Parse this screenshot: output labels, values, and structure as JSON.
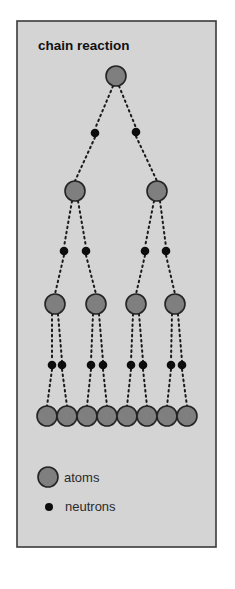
{
  "title": "chain reaction",
  "colors": {
    "page_background": "#ffffff",
    "panel_background": "#d4d4d4",
    "panel_border": "#3a3a3a",
    "atom_fill": "#7f7f7f",
    "atom_stroke": "#242424",
    "neutron_fill": "#0d0d0d",
    "link_color": "#1a1a1a"
  },
  "panel": {
    "x": 17,
    "y": 21,
    "width": 199,
    "height": 526
  },
  "legend": {
    "items": [
      {
        "label": "atoms",
        "symbol": "atom",
        "cx": 48,
        "cy": 477,
        "r": 10,
        "text_x": 64,
        "text_y": 482
      },
      {
        "label": "neutrons",
        "symbol": "neutron",
        "cx": 49,
        "cy": 507,
        "r": 4,
        "text_x": 65,
        "text_y": 511
      }
    ]
  },
  "diagram": {
    "atom_radius": 10,
    "neutron_radius": 4.3,
    "atoms": [
      {
        "id": "a0",
        "level": 0,
        "cx": 116,
        "cy": 76
      },
      {
        "id": "a1",
        "level": 1,
        "cx": 75,
        "cy": 191
      },
      {
        "id": "a2",
        "level": 1,
        "cx": 157,
        "cy": 191
      },
      {
        "id": "a3",
        "level": 2,
        "cx": 55,
        "cy": 304
      },
      {
        "id": "a4",
        "level": 2,
        "cx": 96,
        "cy": 304
      },
      {
        "id": "a5",
        "level": 2,
        "cx": 136,
        "cy": 304
      },
      {
        "id": "a6",
        "level": 2,
        "cx": 175,
        "cy": 304
      },
      {
        "id": "a7",
        "level": 3,
        "cx": 47,
        "cy": 416
      },
      {
        "id": "a8",
        "level": 3,
        "cx": 67,
        "cy": 416
      },
      {
        "id": "a9",
        "level": 3,
        "cx": 87,
        "cy": 416
      },
      {
        "id": "a10",
        "level": 3,
        "cx": 107,
        "cy": 416
      },
      {
        "id": "a11",
        "level": 3,
        "cx": 127,
        "cy": 416
      },
      {
        "id": "a12",
        "level": 3,
        "cx": 147,
        "cy": 416
      },
      {
        "id": "a13",
        "level": 3,
        "cx": 167,
        "cy": 416
      },
      {
        "id": "a14",
        "level": 3,
        "cx": 187,
        "cy": 416
      }
    ],
    "neutrons": [
      {
        "id": "n0",
        "from": "a0",
        "to": "a1",
        "cx": 95,
        "cy": 133
      },
      {
        "id": "n1",
        "from": "a0",
        "to": "a2",
        "cx": 136,
        "cy": 132
      },
      {
        "id": "n2",
        "from": "a1",
        "to": "a3",
        "cx": 64,
        "cy": 251
      },
      {
        "id": "n3",
        "from": "a1",
        "to": "a4",
        "cx": 86,
        "cy": 251
      },
      {
        "id": "n4",
        "from": "a2",
        "to": "a5",
        "cx": 145,
        "cy": 251
      },
      {
        "id": "n5",
        "from": "a2",
        "to": "a6",
        "cx": 166,
        "cy": 251
      },
      {
        "id": "n6",
        "from": "a3",
        "to": "a7",
        "cx": 52,
        "cy": 365
      },
      {
        "id": "n7",
        "from": "a3",
        "to": "a8",
        "cx": 62,
        "cy": 365
      },
      {
        "id": "n8",
        "from": "a4",
        "to": "a9",
        "cx": 91,
        "cy": 365
      },
      {
        "id": "n9",
        "from": "a4",
        "to": "a10",
        "cx": 103,
        "cy": 365
      },
      {
        "id": "n10",
        "from": "a5",
        "to": "a11",
        "cx": 131,
        "cy": 365
      },
      {
        "id": "n11",
        "from": "a5",
        "to": "a12",
        "cx": 143,
        "cy": 365
      },
      {
        "id": "n12",
        "from": "a6",
        "to": "a13",
        "cx": 171,
        "cy": 365
      },
      {
        "id": "n13",
        "from": "a6",
        "to": "a14",
        "cx": 182,
        "cy": 365
      }
    ]
  }
}
